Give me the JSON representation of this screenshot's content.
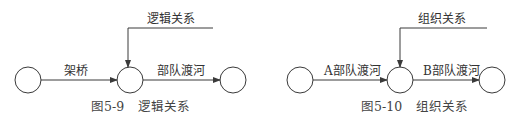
{
  "figures": [
    {
      "caption_number": "图5-9",
      "caption_title": "逻辑关系",
      "top_label": "逻辑关系",
      "edge1_label": "架桥",
      "edge2_label": "部队渡河"
    },
    {
      "caption_number": "图5-10",
      "caption_title": "组织关系",
      "top_label": "组织关系",
      "edge1_label": "A部队渡河",
      "edge2_label": "B部队渡河"
    }
  ],
  "colors": {
    "stroke": "#3a3a3a",
    "background": "#ffffff"
  }
}
